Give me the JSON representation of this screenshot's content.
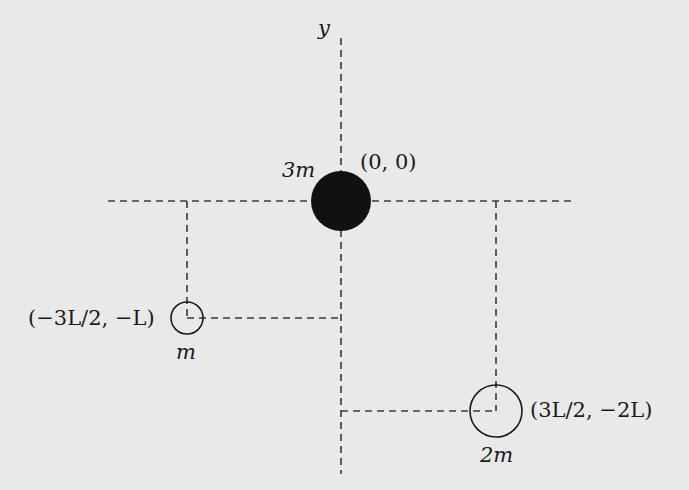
{
  "diagram": {
    "axis_label_y": "y",
    "masses": [
      {
        "id": "center",
        "mass_label": "3m",
        "coord_label": "(0, 0)",
        "fill": "#111111",
        "cx": 341,
        "cy": 201,
        "r": 30
      },
      {
        "id": "left",
        "mass_label": "m",
        "coord_label": "(−3L/2, −L)",
        "fill": "none",
        "cx": 187,
        "cy": 318,
        "r": 16
      },
      {
        "id": "right",
        "mass_label": "2m",
        "coord_label": "(3L/2, −2L)",
        "fill": "none",
        "cx": 496,
        "cy": 411,
        "r": 26
      }
    ],
    "colors": {
      "background": "#e9e9e9",
      "ink": "#1a1a1a",
      "dashes": "#3a3a3a"
    }
  }
}
